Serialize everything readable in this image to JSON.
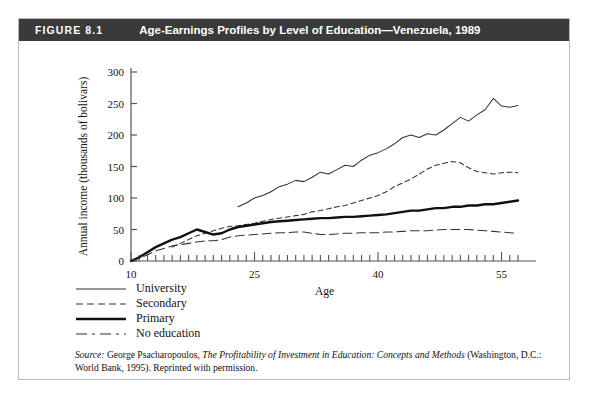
{
  "figure": {
    "number": "FIGURE 8.1",
    "title": "Age-Earnings Profiles by Level of Education—Venezuela, 1989"
  },
  "source": {
    "label": "Source:",
    "author_text": " George Psacharopoulos, ",
    "work_title": "The Profitability of Investment in Education: Concepts and Methods",
    "publication_text": " (Washington, D.C.: World Bank, 1995). Reprinted with permission."
  },
  "legend": {
    "position": "below-plot",
    "items": [
      {
        "label": "University",
        "style": "thin-solid",
        "color": "#333333"
      },
      {
        "label": "Secondary",
        "style": "short-dash",
        "color": "#333333"
      },
      {
        "label": "Primary",
        "style": "thick-solid",
        "color": "#111111"
      },
      {
        "label": "No education",
        "style": "long-dash",
        "color": "#333333"
      }
    ]
  },
  "chart_data": {
    "type": "line",
    "title": "Age-Earnings Profiles by Level of Education—Venezuela, 1989",
    "xlabel": "Age",
    "ylabel": "Annual income (thousands of bolivars)",
    "xlim": [
      10,
      57
    ],
    "ylim": [
      0,
      300
    ],
    "xticks": [
      10,
      25,
      40,
      55
    ],
    "xtick_labels": [
      "10",
      "25",
      "40",
      "55"
    ],
    "xminor_step": 1,
    "yticks": [
      0,
      50,
      100,
      150,
      200,
      250,
      300
    ],
    "ytick_labels": [
      "0",
      "50",
      "100",
      "150",
      "200",
      "250",
      "300"
    ],
    "grid": false,
    "units": "thousands of bolivars",
    "series": [
      {
        "name": "University",
        "style": "thin-solid",
        "color": "#333333",
        "x": [
          23,
          24,
          25,
          26,
          27,
          28,
          29,
          30,
          31,
          32,
          33,
          34,
          35,
          36,
          37,
          38,
          39,
          40,
          41,
          42,
          43,
          44,
          45,
          46,
          47,
          48,
          49,
          50,
          51,
          52,
          53,
          54,
          55,
          56,
          57
        ],
        "values": [
          86,
          92,
          100,
          104,
          110,
          118,
          122,
          128,
          126,
          133,
          141,
          138,
          145,
          152,
          150,
          160,
          168,
          172,
          178,
          186,
          196,
          200,
          196,
          202,
          200,
          208,
          218,
          228,
          222,
          232,
          240,
          258,
          246,
          244,
          247
        ]
      },
      {
        "name": "Secondary",
        "style": "short-dash",
        "color": "#333333",
        "x": [
          15,
          16,
          17,
          18,
          19,
          20,
          21,
          22,
          23,
          24,
          25,
          26,
          27,
          28,
          29,
          30,
          31,
          32,
          33,
          34,
          35,
          36,
          37,
          38,
          39,
          40,
          41,
          42,
          43,
          44,
          45,
          46,
          47,
          48,
          49,
          50,
          51,
          52,
          53,
          54,
          55,
          56,
          57
        ],
        "values": [
          22,
          28,
          34,
          40,
          44,
          48,
          52,
          55,
          56,
          58,
          60,
          63,
          66,
          68,
          70,
          72,
          74,
          78,
          80,
          83,
          86,
          88,
          92,
          96,
          100,
          104,
          110,
          118,
          124,
          130,
          138,
          146,
          152,
          155,
          158,
          156,
          148,
          142,
          140,
          138,
          140,
          141,
          140
        ]
      },
      {
        "name": "Primary",
        "style": "thick-solid",
        "color": "#111111",
        "x": [
          10,
          11,
          12,
          13,
          14,
          15,
          16,
          17,
          18,
          19,
          20,
          21,
          22,
          23,
          24,
          25,
          26,
          27,
          28,
          29,
          30,
          31,
          32,
          33,
          34,
          35,
          36,
          37,
          38,
          39,
          40,
          41,
          42,
          43,
          44,
          45,
          46,
          47,
          48,
          49,
          50,
          51,
          52,
          53,
          54,
          55,
          56,
          57
        ],
        "values": [
          0,
          6,
          14,
          22,
          28,
          34,
          38,
          44,
          50,
          46,
          42,
          44,
          50,
          54,
          56,
          58,
          60,
          62,
          63,
          64,
          65,
          66,
          67,
          68,
          68,
          69,
          70,
          70,
          71,
          72,
          73,
          74,
          76,
          78,
          80,
          80,
          82,
          84,
          84,
          86,
          86,
          88,
          88,
          90,
          90,
          92,
          94,
          96
        ],
        "line_width": 2.4
      },
      {
        "name": "No education",
        "style": "long-dash",
        "color": "#333333",
        "x": [
          10,
          11,
          12,
          13,
          14,
          15,
          16,
          17,
          18,
          19,
          20,
          21,
          22,
          23,
          24,
          25,
          26,
          27,
          28,
          29,
          30,
          31,
          32,
          33,
          34,
          35,
          36,
          37,
          38,
          39,
          40,
          41,
          42,
          43,
          44,
          45,
          46,
          47,
          48,
          49,
          50,
          51,
          52,
          53,
          54,
          55,
          56,
          57
        ],
        "values": [
          0,
          4,
          10,
          16,
          20,
          24,
          26,
          28,
          30,
          32,
          32,
          34,
          38,
          40,
          41,
          42,
          43,
          44,
          45,
          45,
          46,
          46,
          44,
          42,
          42,
          43,
          44,
          44,
          45,
          45,
          45,
          46,
          46,
          47,
          48,
          48,
          48,
          49,
          50,
          50,
          50,
          50,
          49,
          48,
          47,
          46,
          45,
          44
        ]
      }
    ]
  }
}
